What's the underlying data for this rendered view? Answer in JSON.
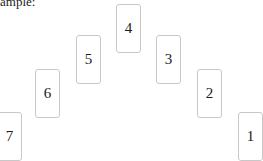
{
  "caption": "ample:",
  "cards": [
    {
      "label": "1",
      "x": 238,
      "y": 112
    },
    {
      "label": "2",
      "x": 197,
      "y": 69
    },
    {
      "label": "3",
      "x": 156,
      "y": 35
    },
    {
      "label": "4",
      "x": 116,
      "y": 4
    },
    {
      "label": "5",
      "x": 76,
      "y": 35
    },
    {
      "label": "6",
      "x": 35,
      "y": 69
    },
    {
      "label": "7",
      "x": -3,
      "y": 112
    }
  ]
}
